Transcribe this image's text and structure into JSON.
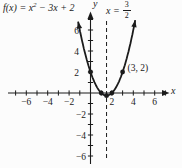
{
  "figure": {
    "background": "#fcfcfc",
    "ink": "#1b1b1b"
  },
  "chart_data": {
    "type": "line",
    "title": "",
    "function": {
      "expression": "f(x) = x² − 3x + 2",
      "label_parts": {
        "prefix": "f(x) = x",
        "exponent": "2",
        "suffix": " − 3x + 2"
      },
      "coefficients": {
        "a": 1,
        "b": -3,
        "c": 2
      },
      "plot_domain": [
        -1.155,
        4.18
      ]
    },
    "vertical_line": {
      "x": 1.5,
      "style": "dashed",
      "label_parts": {
        "prefix": "x =",
        "numerator": "3",
        "denominator": "2"
      }
    },
    "points": [
      {
        "x": 0,
        "y": 2,
        "label": ""
      },
      {
        "x": 1,
        "y": 0,
        "label": ""
      },
      {
        "x": 2,
        "y": 0,
        "label": ""
      },
      {
        "x": 1.5,
        "y": -0.25,
        "label": ""
      },
      {
        "x": 3,
        "y": 2,
        "label": "(3, 2)"
      }
    ],
    "axes": {
      "x_label": "x",
      "y_label": "y",
      "xlim": [
        -7.7,
        7.4
      ],
      "ylim": [
        -6.9,
        7.8
      ],
      "x_ticks": [
        -7,
        -6,
        -5,
        -4,
        -3,
        -2,
        -1,
        1,
        2,
        3,
        4,
        5,
        6,
        7
      ],
      "y_ticks": [
        -6,
        -5,
        -4,
        -3,
        -2,
        -1,
        1,
        2,
        3,
        4,
        5,
        6,
        7
      ],
      "x_tick_labels": [
        {
          "value": -6,
          "text": "−6"
        },
        {
          "value": -4,
          "text": "−4"
        },
        {
          "value": -2,
          "text": "−2"
        },
        {
          "value": 2,
          "text": "2"
        },
        {
          "value": 4,
          "text": "4"
        },
        {
          "value": 6,
          "text": "6"
        }
      ],
      "y_tick_labels": [
        {
          "value": 6,
          "text": "6"
        },
        {
          "value": 4,
          "text": "4"
        },
        {
          "value": 2,
          "text": "2"
        },
        {
          "value": -2,
          "text": "−2"
        },
        {
          "value": -4,
          "text": "−4"
        },
        {
          "value": -6,
          "text": "−6"
        }
      ]
    },
    "grid": false,
    "legend": false
  }
}
